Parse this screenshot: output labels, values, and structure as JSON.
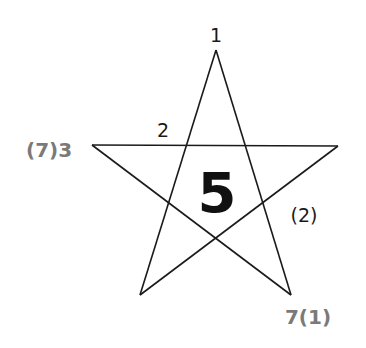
{
  "diagram": {
    "type": "pentagram",
    "colors": {
      "line": "#1a1a1a",
      "dark_label": "#1a1a1a",
      "grey_label": "#7a7a7a",
      "center_label": "#111111"
    },
    "center_label": "5",
    "labels": {
      "top": "1",
      "left": "(7)3",
      "upper_left_edge": "2",
      "right_edge": "(2)",
      "bottom_right": "7(1)"
    }
  }
}
